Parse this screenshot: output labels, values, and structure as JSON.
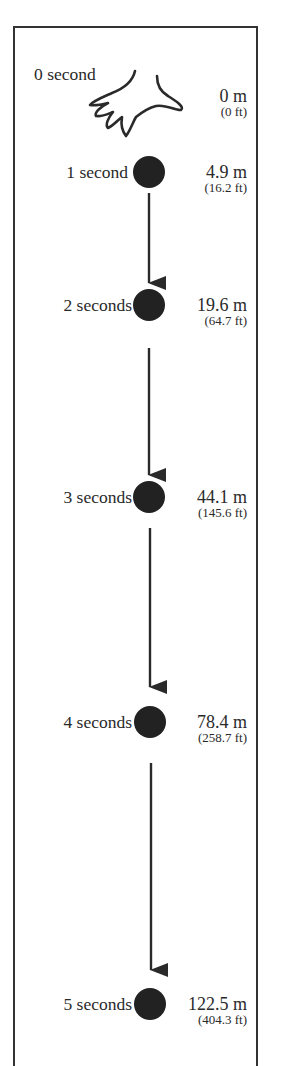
{
  "diagram": {
    "title": "",
    "colors": {
      "ink": "#2a2a2a",
      "ball": "#222222",
      "frame": "#333333",
      "background": "#ffffff"
    },
    "start": {
      "time_label": "0 second",
      "distance_m": "0 m",
      "distance_ft": "(0 ft)",
      "icon": "hand-icon"
    },
    "steps": [
      {
        "time_label": "1 second",
        "distance_m": "4.9 m",
        "distance_ft": "(16.2 ft)"
      },
      {
        "time_label": "2 seconds",
        "distance_m": "19.6 m",
        "distance_ft": "(64.7 ft)"
      },
      {
        "time_label": "3 seconds",
        "distance_m": "44.1 m",
        "distance_ft": "(145.6 ft)"
      },
      {
        "time_label": "4 seconds",
        "distance_m": "78.4 m",
        "distance_ft": "(258.7 ft)"
      },
      {
        "time_label": "5 seconds",
        "distance_m": "122.5 m",
        "distance_ft": "(404.3 ft)"
      }
    ]
  }
}
